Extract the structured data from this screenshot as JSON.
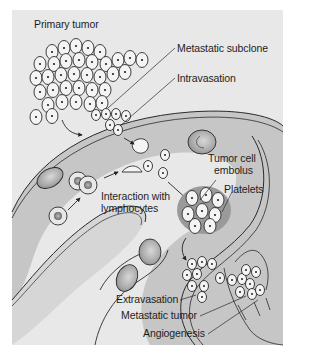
{
  "diagram": {
    "colors": {
      "panel": "#e8e8e8",
      "vessel_fill": "#c6c6c6",
      "vessel_wall": "#f2f2f2",
      "outline": "#2a2a2a",
      "cell_fill": "#f4f4f4",
      "tissue": "#ececec",
      "text": "#1e1e1e"
    },
    "labels": {
      "primary_tumor": "Primary tumor",
      "metastatic_subclone": "Metastatic subclone",
      "intravasation": "Intravasation",
      "tumor_cell_embolus_1": "Tumor cell",
      "tumor_cell_embolus_2": "embolus",
      "platelets": "Platelets",
      "interaction_1": "Interaction with",
      "interaction_2": "lymphocytes",
      "extravasation": "Extravasation",
      "metastatic_tumor": "Metastatic tumor",
      "angiogenesis": "Angiogenesis"
    },
    "steps": [
      "Primary tumor",
      "Metastatic subclone",
      "Intravasation",
      "Interaction with lymphocytes",
      "Tumor cell embolus",
      "Platelets",
      "Extravasation",
      "Metastatic tumor",
      "Angiogenesis"
    ]
  }
}
